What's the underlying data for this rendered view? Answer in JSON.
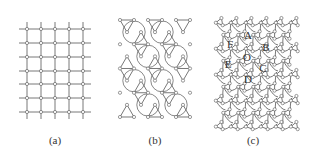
{
  "figure": {
    "panels": [
      {
        "id": "a",
        "caption": "(a)",
        "lattice": "square",
        "caption_pos": [
          55,
          140
        ]
      },
      {
        "id": "b",
        "caption": "(b)",
        "lattice": "kagome",
        "caption_pos": [
          155,
          140
        ]
      },
      {
        "id": "c",
        "caption": "(c)",
        "lattice": "twisted-kagome",
        "caption_pos": [
          253,
          140
        ]
      }
    ],
    "cell_labels": [
      {
        "text": "A",
        "x": 248,
        "y": 35
      },
      {
        "text": "B",
        "x": 266,
        "y": 47
      },
      {
        "text": "C",
        "x": 263,
        "y": 68
      },
      {
        "text": "D",
        "x": 248,
        "y": 79
      },
      {
        "text": "E",
        "x": 228,
        "y": 64
      },
      {
        "text": "F",
        "x": 230,
        "y": 44
      },
      {
        "text": "O",
        "x": 247,
        "y": 57
      }
    ],
    "colors": {
      "line": "#555555",
      "node_fill": "#ffffff",
      "node_stroke": "#555555",
      "text": "#333333"
    }
  }
}
